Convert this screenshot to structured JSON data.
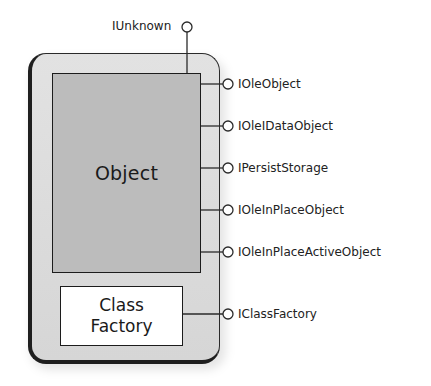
{
  "diagram": {
    "colors": {
      "object_fill": "#bcbcbc",
      "container_fill": "#dcdcdc",
      "factory_fill": "#ffffff",
      "line": "#2a2a2a"
    },
    "top_interface": {
      "label": "IUnknown"
    },
    "object": {
      "label": "Object"
    },
    "class_factory": {
      "line1": "Class",
      "line2": "Factory"
    },
    "interfaces": [
      {
        "label": "IOleObject"
      },
      {
        "label": "IOleIDataObject"
      },
      {
        "label": "IPersistStorage"
      },
      {
        "label": "IOleInPlaceObject"
      },
      {
        "label": "IOleInPlaceActiveObject"
      },
      {
        "label": "IClassFactory"
      }
    ]
  }
}
